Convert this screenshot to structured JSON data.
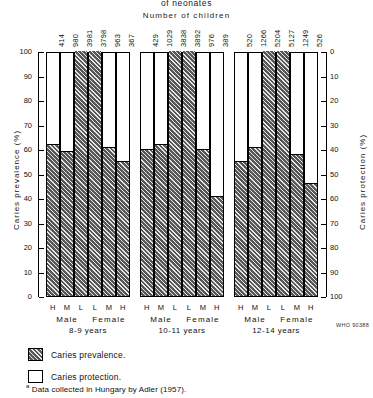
{
  "header": {
    "title": "of neonates",
    "subtitle": "Number of children"
  },
  "axes": {
    "left_title": "Caries prevalence (%)",
    "right_title": "Caries protection (%)",
    "left_ticks": [
      "100",
      "90",
      "80",
      "70",
      "60",
      "50",
      "40",
      "30",
      "20",
      "10",
      "0"
    ],
    "right_ticks": [
      "0",
      "10",
      "20",
      "30",
      "40",
      "50",
      "60",
      "70",
      "80",
      "90",
      "100"
    ]
  },
  "legend": {
    "items": [
      {
        "label": "Caries prevalence.",
        "swatch": "hatch"
      },
      {
        "label": "Caries protection.",
        "swatch": "plain"
      }
    ],
    "footnote_marker": "a",
    "footnote": " Data collected in Hungary by Adler (1957)."
  },
  "who_code": "WHO 90388",
  "groups": [
    {
      "age": "8-9 years",
      "sex_labels": [
        "Male",
        "Female"
      ],
      "bars": [
        {
          "fluoride": "H",
          "n": "414",
          "prevalence": 62
        },
        {
          "fluoride": "M",
          "n": "980",
          "prevalence": 59
        },
        {
          "fluoride": "L",
          "n": "3981",
          "prevalence": 100
        },
        {
          "fluoride": "L",
          "n": "3798",
          "prevalence": 100
        },
        {
          "fluoride": "M",
          "n": "963",
          "prevalence": 61
        },
        {
          "fluoride": "H",
          "n": "367",
          "prevalence": 55
        }
      ]
    },
    {
      "age": "10-11 years",
      "sex_labels": [
        "Male",
        "Female"
      ],
      "bars": [
        {
          "fluoride": "H",
          "n": "429",
          "prevalence": 60
        },
        {
          "fluoride": "M",
          "n": "1029",
          "prevalence": 62
        },
        {
          "fluoride": "L",
          "n": "3838",
          "prevalence": 100
        },
        {
          "fluoride": "L",
          "n": "3892",
          "prevalence": 100
        },
        {
          "fluoride": "M",
          "n": "976",
          "prevalence": 60
        },
        {
          "fluoride": "H",
          "n": "389",
          "prevalence": 41
        }
      ]
    },
    {
      "age": "12-14 years",
      "sex_labels": [
        "Male",
        "Female"
      ],
      "bars": [
        {
          "fluoride": "H",
          "n": "520",
          "prevalence": 55
        },
        {
          "fluoride": "M",
          "n": "1266",
          "prevalence": 61
        },
        {
          "fluoride": "L",
          "n": "5204",
          "prevalence": 100
        },
        {
          "fluoride": "L",
          "n": "5127",
          "prevalence": 100
        },
        {
          "fluoride": "M",
          "n": "1249",
          "prevalence": 58
        },
        {
          "fluoride": "H",
          "n": "526",
          "prevalence": 46
        }
      ]
    }
  ],
  "chart_data": {
    "type": "bar",
    "title": "Number of children",
    "xlabel": "",
    "ylabel": "Caries prevalence (%)",
    "y2label": "Caries protection (%)",
    "ylim": [
      0,
      100
    ],
    "y2lim": [
      100,
      0
    ],
    "grid": false,
    "legend_position": "bottom-left",
    "categories": [
      "8-9 Male H",
      "8-9 Male M",
      "8-9 Male L",
      "8-9 Female L",
      "8-9 Female M",
      "8-9 Female H",
      "10-11 Male H",
      "10-11 Male M",
      "10-11 Male L",
      "10-11 Female L",
      "10-11 Female M",
      "10-11 Female H",
      "12-14 Male H",
      "12-14 Male M",
      "12-14 Male L",
      "12-14 Female L",
      "12-14 Female M",
      "12-14 Female H"
    ],
    "series": [
      {
        "name": "Caries prevalence.",
        "values": [
          62,
          59,
          100,
          100,
          61,
          55,
          60,
          62,
          100,
          100,
          60,
          41,
          55,
          61,
          100,
          100,
          58,
          46
        ]
      },
      {
        "name": "Caries protection.",
        "values": [
          38,
          41,
          0,
          0,
          39,
          45,
          40,
          38,
          0,
          0,
          40,
          59,
          45,
          39,
          0,
          0,
          42,
          54
        ]
      }
    ],
    "number_of_children": [
      414,
      980,
      3981,
      3798,
      963,
      367,
      429,
      1029,
      3838,
      3892,
      976,
      389,
      520,
      1266,
      5204,
      5127,
      1249,
      526
    ],
    "annotations": [
      "WHO 90388",
      "a Data collected in Hungary by Adler (1957)."
    ]
  }
}
